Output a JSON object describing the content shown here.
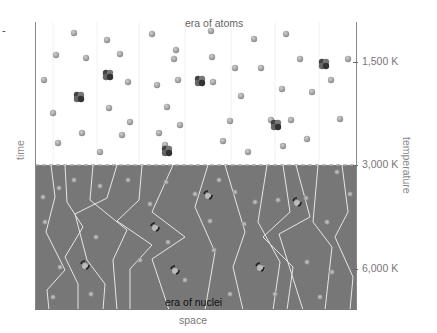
{
  "figure": {
    "top_region_label": "era of atoms",
    "bottom_region_label": "era of nuclei",
    "x_axis_label": "space",
    "y_axis_left_label": "time",
    "y_axis_right_label": "temperature",
    "temperature_ticks": [
      {
        "label": "1,500 K"
      },
      {
        "label": "3,000 K"
      },
      {
        "label": "6,000 K"
      }
    ],
    "colors": {
      "atoms_background": "#ffffff",
      "nuclei_background": "#777777",
      "photon_path": "#e8e8e8",
      "particle": "#9a9a9a",
      "heavy_nucleus": "#333333",
      "axis": "#888888",
      "text": "#777777"
    },
    "legend_mark": "-"
  }
}
